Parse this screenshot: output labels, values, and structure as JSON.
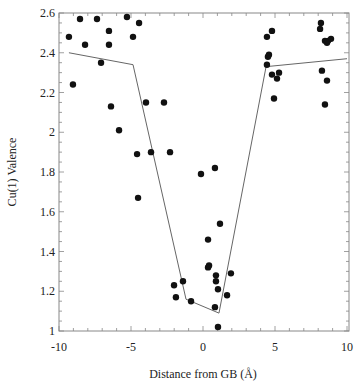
{
  "chart_data": {
    "type": "scatter",
    "title": "",
    "xlabel": "Distance from GB (Å)",
    "ylabel": "Cu(1) Valence",
    "xlim": [
      -10,
      10
    ],
    "ylim": [
      1,
      2.6
    ],
    "grid": false,
    "legend": null,
    "x_ticks": [
      "-10",
      "-5",
      "0",
      "5",
      "10"
    ],
    "y_ticks": [
      "1",
      "1.2",
      "1.4",
      "1.6",
      "1.8",
      "2",
      "2.2",
      "2.4",
      "2.6"
    ],
    "series": [
      {
        "name": "data points",
        "kind": "scatter",
        "points": [
          [
            -8.54,
            2.57
          ],
          [
            -7.36,
            2.57
          ],
          [
            -5.28,
            2.58
          ],
          [
            -4.44,
            2.55
          ],
          [
            -6.53,
            2.51
          ],
          [
            -9.31,
            2.48
          ],
          [
            -4.86,
            2.48
          ],
          [
            -8.19,
            2.44
          ],
          [
            -6.53,
            2.44
          ],
          [
            -7.08,
            2.35
          ],
          [
            -9.03,
            2.24
          ],
          [
            -6.39,
            2.13
          ],
          [
            -3.96,
            2.15
          ],
          [
            -2.71,
            2.15
          ],
          [
            -5.83,
            2.01
          ],
          [
            -4.58,
            1.89
          ],
          [
            -3.61,
            1.9
          ],
          [
            -2.29,
            1.9
          ],
          [
            -0.14,
            1.79
          ],
          [
            0.83,
            1.82
          ],
          [
            -4.51,
            1.67
          ],
          [
            1.18,
            1.54
          ],
          [
            0.35,
            1.46
          ],
          [
            0.42,
            1.33
          ],
          [
            0.35,
            1.32
          ],
          [
            1.94,
            1.29
          ],
          [
            0.9,
            1.28
          ],
          [
            0.9,
            1.25
          ],
          [
            -1.39,
            1.25
          ],
          [
            -2.01,
            1.23
          ],
          [
            1.04,
            1.21
          ],
          [
            1.67,
            1.18
          ],
          [
            -1.88,
            1.17
          ],
          [
            -0.83,
            1.15
          ],
          [
            0.83,
            1.12
          ],
          [
            1.04,
            1.02
          ],
          [
            4.79,
            2.51
          ],
          [
            4.44,
            2.48
          ],
          [
            4.58,
            2.39
          ],
          [
            4.51,
            2.38
          ],
          [
            4.44,
            2.34
          ],
          [
            4.79,
            2.29
          ],
          [
            5.28,
            2.3
          ],
          [
            5.14,
            2.27
          ],
          [
            8.19,
            2.55
          ],
          [
            8.13,
            2.52
          ],
          [
            8.47,
            2.46
          ],
          [
            8.68,
            2.46
          ],
          [
            8.89,
            2.47
          ],
          [
            8.61,
            2.45
          ],
          [
            8.26,
            2.31
          ],
          [
            8.61,
            2.26
          ],
          [
            4.93,
            2.17
          ],
          [
            8.47,
            2.14
          ]
        ]
      },
      {
        "name": "guide line",
        "kind": "line",
        "points": [
          [
            -9.31,
            2.4
          ],
          [
            -4.86,
            2.34
          ],
          [
            -1.18,
            1.16
          ],
          [
            1.11,
            1.09
          ],
          [
            4.38,
            2.33
          ],
          [
            10,
            2.37
          ]
        ]
      }
    ]
  },
  "colors": {
    "points": "#111111",
    "line": "#666666",
    "axis": "#888888",
    "text": "#222222"
  }
}
